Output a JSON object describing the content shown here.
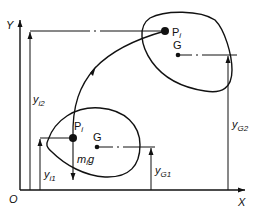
{
  "axes": {
    "x_label": "X",
    "y_label": "Y",
    "origin_label": "O"
  },
  "upper_body": {
    "point_label": "P",
    "point_subscript": "i",
    "centroid_label": "G"
  },
  "lower_body": {
    "point_label": "P",
    "point_subscript": "i",
    "centroid_label": "G",
    "weight_label_m": "m",
    "weight_label_sub": "i",
    "weight_label_g": "g"
  },
  "dimensions": {
    "yi2": {
      "base": "y",
      "sub": "i2"
    },
    "yi1": {
      "base": "y",
      "sub": "i1"
    },
    "yG2": {
      "base": "y",
      "sub": "G2"
    },
    "yG1": {
      "base": "y",
      "sub": "G1"
    }
  },
  "colors": {
    "ink": "#111111",
    "background": "#ffffff"
  }
}
